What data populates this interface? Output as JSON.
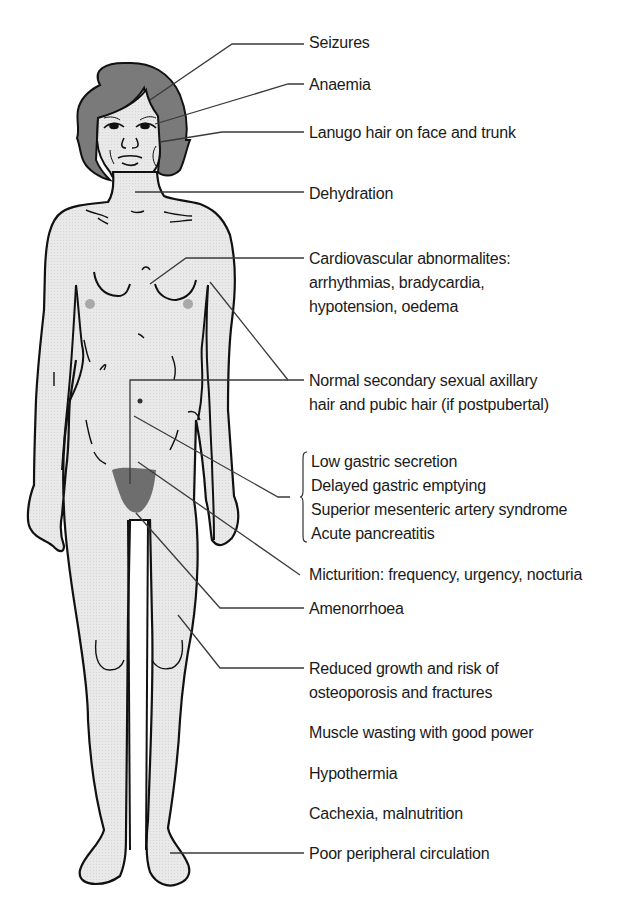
{
  "figure": {
    "colors": {
      "skin": "#e6e6e6",
      "hair": "#7a7a7a",
      "outline": "#111111",
      "leader_line": "#3a3a3a",
      "text": "#1a1a1a",
      "pubic_hair": "#6e6e6e",
      "areola": "#a8a8a8"
    }
  },
  "labels": [
    {
      "id": "seizures",
      "lines": [
        "Seizures"
      ]
    },
    {
      "id": "anaemia",
      "lines": [
        "Anaemia"
      ]
    },
    {
      "id": "lanugo",
      "lines": [
        "Lanugo hair on face and trunk"
      ]
    },
    {
      "id": "dehydration",
      "lines": [
        "Dehydration"
      ]
    },
    {
      "id": "cardiovascular",
      "lines": [
        "Cardiovascular abnormalites:",
        "arrhythmias, bradycardia,",
        "hypotension, oedema"
      ]
    },
    {
      "id": "secondary-sexual-hair",
      "lines": [
        "Normal secondary sexual axillary",
        "hair and pubic hair (if postpubertal)"
      ]
    },
    {
      "id": "gastric-group",
      "lines": [
        "Low gastric secretion",
        "Delayed gastric emptying",
        "Superior mesenteric artery syndrome",
        "Acute pancreatitis"
      ]
    },
    {
      "id": "micturition",
      "lines": [
        "Micturition: frequency, urgency, nocturia"
      ]
    },
    {
      "id": "amenorrhoea",
      "lines": [
        "Amenorrhoea"
      ]
    },
    {
      "id": "reduced-growth",
      "lines": [
        "Reduced growth and risk of",
        "osteoporosis and fractures"
      ]
    },
    {
      "id": "muscle-wasting",
      "lines": [
        "Muscle wasting with good power"
      ]
    },
    {
      "id": "hypothermia",
      "lines": [
        "Hypothermia"
      ]
    },
    {
      "id": "cachexia",
      "lines": [
        "Cachexia, malnutrition"
      ]
    },
    {
      "id": "peripheral-circulation",
      "lines": [
        "Poor peripheral circulation"
      ]
    }
  ]
}
